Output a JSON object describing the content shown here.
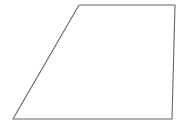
{
  "canvas": {
    "width": 183,
    "height": 125,
    "background_color": "#ffffff",
    "name": "geometry-figure-canvas"
  },
  "figure": {
    "type": "polygon",
    "shape_name": "trapezoid",
    "stroke_color": "#666666",
    "fill_color": "#ffffff",
    "stroke_width": 1.1,
    "vertices": [
      {
        "label": "top-left",
        "x": 79,
        "y": 5
      },
      {
        "label": "top-right",
        "x": 175,
        "y": 5
      },
      {
        "label": "bottom-right",
        "x": 172,
        "y": 119
      },
      {
        "label": "bottom-left",
        "x": 13,
        "y": 119
      }
    ],
    "points_attr": "79,5 175,5 172,119 13,119",
    "edges": [
      {
        "label": "top-edge",
        "from": "top-left",
        "to": "top-right"
      },
      {
        "label": "right-edge",
        "from": "top-right",
        "to": "bottom-right"
      },
      {
        "label": "bottom-edge",
        "from": "bottom-right",
        "to": "bottom-left"
      },
      {
        "label": "left-slanted-edge",
        "from": "bottom-left",
        "to": "top-left"
      }
    ]
  },
  "labels": {
    "none_visible": ""
  }
}
